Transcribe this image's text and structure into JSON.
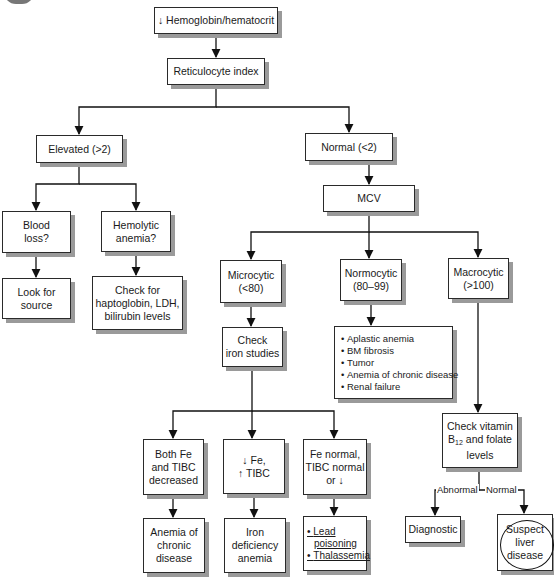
{
  "diagram": {
    "type": "flowchart",
    "title_node": "↓ Hemoglobin/hematocrit",
    "nodes": {
      "hemoglobin": {
        "lines": [
          "↓ Hemoglobin/hematocrit"
        ]
      },
      "reticulocyte": {
        "lines": [
          "Reticulocyte index"
        ]
      },
      "elevated": {
        "lines": [
          "Elevated (>2)"
        ]
      },
      "normal": {
        "lines": [
          "Normal (<2)"
        ]
      },
      "blood_loss": {
        "lines": [
          "Blood",
          "loss?"
        ]
      },
      "hemolytic": {
        "lines": [
          "Hemolytic",
          "anemia?"
        ]
      },
      "look_source": {
        "lines": [
          "Look for",
          "source"
        ]
      },
      "check_hapto": {
        "lines": [
          "Check for",
          "haptoglobin, LDH,",
          "bilirubin levels"
        ]
      },
      "mcv": {
        "lines": [
          "MCV"
        ]
      },
      "microcytic": {
        "lines": [
          "Microcytic",
          "(<80)"
        ]
      },
      "normocytic": {
        "lines": [
          "Normocytic",
          "(80–99)"
        ]
      },
      "macrocytic": {
        "lines": [
          "Macrocytic",
          "(>100)"
        ]
      },
      "check_iron": {
        "lines": [
          "Check",
          "iron studies"
        ]
      },
      "normocytic_causes": {
        "items": [
          "Aplastic anemia",
          "BM fibrosis",
          "Tumor",
          "Anemia of chronic disease",
          "Renal failure"
        ]
      },
      "check_b12": {
        "line1": "Check vitamin",
        "line2_pre": "B",
        "line2_sub": "12",
        "line2_post": " and folate",
        "line3": "levels"
      },
      "both_dec": {
        "lines": [
          "Both Fe",
          "and TIBC",
          "decreased"
        ]
      },
      "fe_low": {
        "lines": [
          "↓ Fe,",
          "↑ TIBC"
        ]
      },
      "fe_normal": {
        "lines": [
          "Fe normal,",
          "TIBC normal",
          "or ↓"
        ]
      },
      "anemia_chronic": {
        "lines": [
          "Anemia of",
          "chronic",
          "disease"
        ]
      },
      "iron_def": {
        "lines": [
          "Iron",
          "deficiency",
          "anemia"
        ]
      },
      "lead_thal": {
        "items": [
          "Lead",
          "poisoning",
          "Thalassemia"
        ]
      },
      "diagnostic": {
        "lines": [
          "Diagnostic"
        ]
      },
      "liver": {
        "lines": [
          "Suspect",
          "liver",
          "disease"
        ]
      }
    },
    "edge_labels": {
      "abnormal": "Abnormal",
      "normal": "Normal"
    },
    "edges": [
      [
        "hemoglobin",
        "reticulocyte"
      ],
      [
        "reticulocyte",
        "elevated"
      ],
      [
        "reticulocyte",
        "normal"
      ],
      [
        "elevated",
        "blood_loss"
      ],
      [
        "elevated",
        "hemolytic"
      ],
      [
        "blood_loss",
        "look_source"
      ],
      [
        "hemolytic",
        "check_hapto"
      ],
      [
        "normal",
        "mcv"
      ],
      [
        "mcv",
        "microcytic"
      ],
      [
        "mcv",
        "normocytic"
      ],
      [
        "mcv",
        "macrocytic"
      ],
      [
        "microcytic",
        "check_iron"
      ],
      [
        "normocytic",
        "normocytic_causes"
      ],
      [
        "macrocytic",
        "check_b12"
      ],
      [
        "check_iron",
        "both_dec"
      ],
      [
        "check_iron",
        "fe_low"
      ],
      [
        "check_iron",
        "fe_normal"
      ],
      [
        "both_dec",
        "anemia_chronic"
      ],
      [
        "fe_low",
        "iron_def"
      ],
      [
        "fe_normal",
        "lead_thal"
      ],
      [
        "check_b12",
        "diagnostic",
        "Abnormal"
      ],
      [
        "check_b12",
        "liver",
        "Normal"
      ]
    ],
    "colors": {
      "border": "#2a2a2a",
      "shadow": "#9a9a9a",
      "background": "#ffffff",
      "text": "#1a1a1a"
    }
  }
}
